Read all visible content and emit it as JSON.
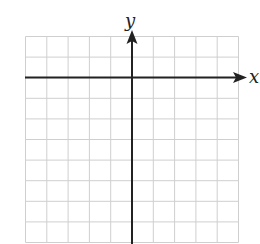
{
  "diagram": {
    "type": "coordinate-grid",
    "x_axis_label": "x",
    "y_axis_label": "y",
    "grid": {
      "columns": 10,
      "rows": 10
    },
    "origin_cell": {
      "column": 5,
      "row": 2
    },
    "colors": {
      "grid": "#cfcfcf",
      "axis": "#222222",
      "background": "#ffffff"
    }
  }
}
